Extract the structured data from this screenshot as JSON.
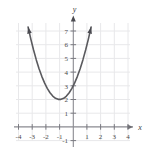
{
  "figure": {
    "background_color": "#ffffff",
    "width": 153,
    "height": 152
  },
  "chart_data": {
    "type": "line",
    "title": "",
    "subtitle": "",
    "xlabel": "x",
    "ylabel": "y",
    "xlim": [
      -4,
      4
    ],
    "ylim": [
      -1,
      7.6
    ],
    "grid": true,
    "grid_color": "#e8e8ea",
    "legend": null,
    "legend_position": "none",
    "axis_color": "#8a8a90",
    "axis_arrowheads": true,
    "curve_color": "#5a5a5e",
    "curve_arrowheads": true,
    "x_ticks": [
      -4,
      -3,
      -2,
      -1,
      1,
      2,
      3,
      4
    ],
    "x_tick_labels": [
      "-4",
      "-3",
      "-2",
      "-1",
      "1",
      "2",
      "3",
      "4"
    ],
    "y_ticks": [
      -1,
      1,
      2,
      3,
      4,
      5,
      6,
      7
    ],
    "y_tick_labels": [
      "-1",
      "1",
      "2",
      "3",
      "4",
      "5",
      "6",
      "7"
    ],
    "series": [
      {
        "name": "parabola",
        "equation": "y = (x + 1)^2 + 2",
        "expanded": "y = x^2 + 2x + 3",
        "vertex": [
          -1,
          2
        ],
        "y_intercept": [
          0,
          3
        ],
        "leading_coefficient": 1,
        "opens": "up",
        "x": [
          -3.3,
          -3.1,
          -2.9,
          -2.7,
          -2.5,
          -2.3,
          -2.1,
          -1.9,
          -1.7,
          -1.5,
          -1.3,
          -1.1,
          -0.9,
          -0.7,
          -0.5,
          -0.3,
          -0.1,
          0.1,
          0.3,
          0.5,
          0.7,
          0.9,
          1.1,
          1.3
        ],
        "values": [
          7.29,
          6.41,
          5.61,
          4.89,
          4.25,
          3.69,
          3.21,
          2.81,
          2.49,
          2.25,
          2.09,
          2.01,
          2.01,
          2.09,
          2.25,
          2.49,
          2.81,
          3.21,
          3.69,
          4.25,
          4.89,
          5.61,
          6.41,
          7.29
        ]
      }
    ]
  }
}
